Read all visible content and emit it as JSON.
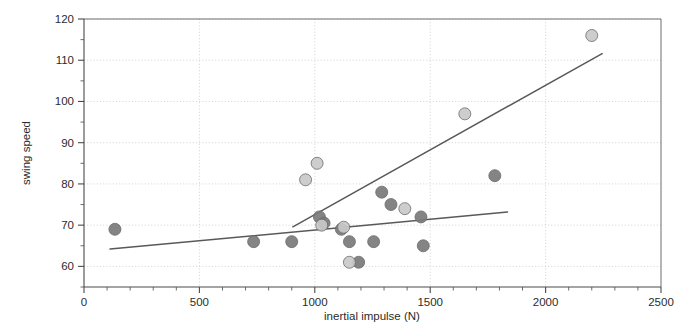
{
  "chart_data": {
    "type": "scatter",
    "title": "",
    "xlabel": "inertial impulse (N)",
    "ylabel": "swing speed",
    "xlim": [
      0,
      2500
    ],
    "ylim": [
      55,
      120
    ],
    "grid": true,
    "legend_position": "none",
    "x_ticks": [
      0,
      500,
      1000,
      1500,
      2000,
      2500
    ],
    "x_tick_labels": [
      "0",
      "500",
      "1000",
      "1500",
      "2000",
      "2500"
    ],
    "x_minor_step": 100,
    "y_ticks": [
      60,
      70,
      80,
      90,
      100,
      110,
      120
    ],
    "y_tick_labels": [
      "60",
      "70",
      "80",
      "90",
      "100",
      "110",
      "120"
    ],
    "y_minor_step": 5,
    "colors": {
      "dark_marker": "#7a7a7a",
      "light_marker": "#c9c9c9",
      "marker_edge": "#6b6b6b",
      "trend_line": "#595959",
      "grid": "#c9c9c9",
      "axis": "#4a4a4a",
      "background": "#ffffff"
    },
    "series": [
      {
        "name": "dark group",
        "marker": "circle",
        "color": "#7a7a7a",
        "points": [
          {
            "x": 134,
            "y": 69
          },
          {
            "x": 735,
            "y": 66
          },
          {
            "x": 900,
            "y": 66
          },
          {
            "x": 1020,
            "y": 72
          },
          {
            "x": 1040,
            "y": 70.5
          },
          {
            "x": 1115,
            "y": 69
          },
          {
            "x": 1150,
            "y": 66
          },
          {
            "x": 1190,
            "y": 61
          },
          {
            "x": 1255,
            "y": 66
          },
          {
            "x": 1290,
            "y": 78
          },
          {
            "x": 1330,
            "y": 75
          },
          {
            "x": 1460,
            "y": 72
          },
          {
            "x": 1470,
            "y": 65
          },
          {
            "x": 1780,
            "y": 82
          }
        ]
      },
      {
        "name": "light group",
        "marker": "circle",
        "color": "#c9c9c9",
        "points": [
          {
            "x": 960,
            "y": 81
          },
          {
            "x": 1010,
            "y": 85
          },
          {
            "x": 1030,
            "y": 70
          },
          {
            "x": 1125,
            "y": 69.5
          },
          {
            "x": 1150,
            "y": 61
          },
          {
            "x": 1390,
            "y": 74
          },
          {
            "x": 1650,
            "y": 97
          },
          {
            "x": 2200,
            "y": 116
          }
        ]
      }
    ],
    "trend_lines": [
      {
        "name": "shallow-trend",
        "x_start": 113,
        "y_start": 64.2,
        "x_end": 1835,
        "y_end": 73.2
      },
      {
        "name": "steep-trend",
        "x_start": 905,
        "y_start": 69.6,
        "x_end": 2245,
        "y_end": 111.6
      }
    ]
  }
}
